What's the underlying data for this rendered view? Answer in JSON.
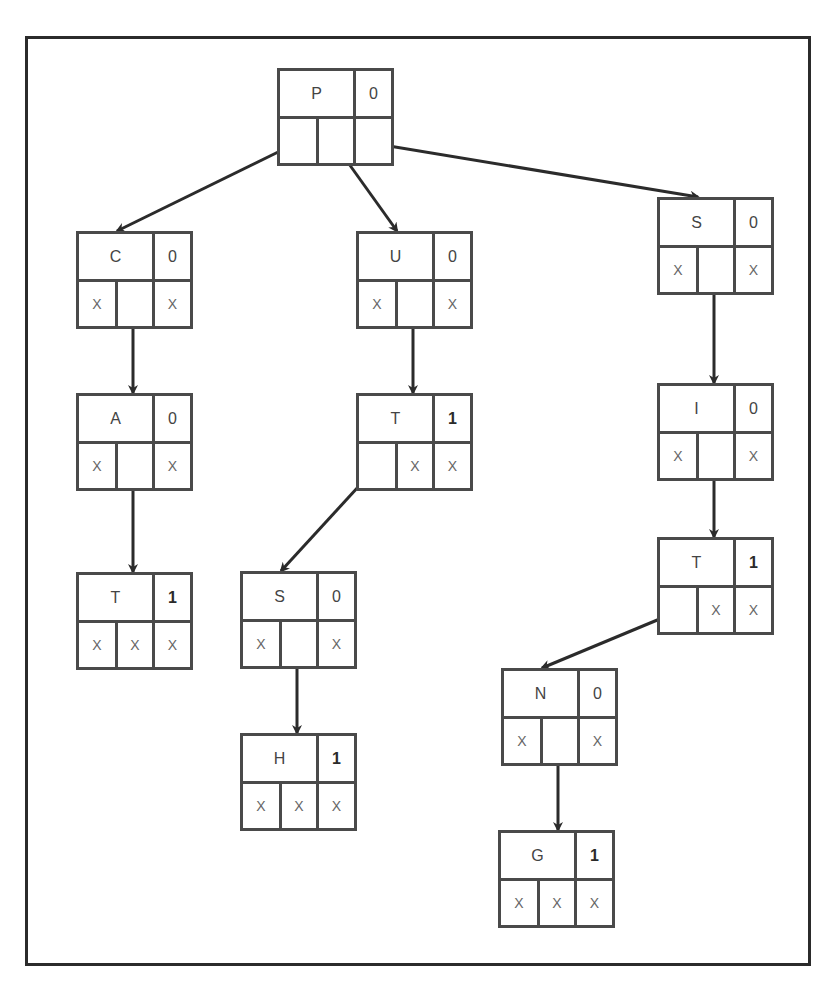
{
  "diagram": {
    "type": "trie",
    "cell_empty_marker": "X",
    "nodes": [
      {
        "id": "P",
        "letter": "P",
        "end_flag": "0",
        "children": [
          "",
          "",
          ""
        ]
      },
      {
        "id": "C",
        "letter": "C",
        "end_flag": "0",
        "children": [
          "X",
          "",
          "X"
        ]
      },
      {
        "id": "U",
        "letter": "U",
        "end_flag": "0",
        "children": [
          "X",
          "",
          "X"
        ]
      },
      {
        "id": "S1",
        "letter": "S",
        "end_flag": "0",
        "children": [
          "X",
          "",
          "X"
        ]
      },
      {
        "id": "A",
        "letter": "A",
        "end_flag": "0",
        "children": [
          "X",
          "",
          "X"
        ]
      },
      {
        "id": "T1",
        "letter": "T",
        "end_flag": "1",
        "children": [
          "",
          "X",
          "X"
        ]
      },
      {
        "id": "I",
        "letter": "I",
        "end_flag": "0",
        "children": [
          "X",
          "",
          "X"
        ]
      },
      {
        "id": "T2",
        "letter": "T",
        "end_flag": "1",
        "children": [
          "X",
          "X",
          "X"
        ]
      },
      {
        "id": "S2",
        "letter": "S",
        "end_flag": "0",
        "children": [
          "X",
          "",
          "X"
        ]
      },
      {
        "id": "T3",
        "letter": "T",
        "end_flag": "1",
        "children": [
          "",
          "X",
          "X"
        ]
      },
      {
        "id": "N",
        "letter": "N",
        "end_flag": "0",
        "children": [
          "X",
          "",
          "X"
        ]
      },
      {
        "id": "H",
        "letter": "H",
        "end_flag": "1",
        "children": [
          "X",
          "X",
          "X"
        ]
      },
      {
        "id": "G",
        "letter": "G",
        "end_flag": "1",
        "children": [
          "X",
          "X",
          "X"
        ]
      }
    ],
    "edges": [
      {
        "from": "P",
        "from_cell": 0,
        "to": "C"
      },
      {
        "from": "P",
        "from_cell": 1,
        "to": "U"
      },
      {
        "from": "P",
        "from_cell": 2,
        "to": "S1"
      },
      {
        "from": "C",
        "from_cell": 1,
        "to": "A"
      },
      {
        "from": "U",
        "from_cell": 1,
        "to": "T1"
      },
      {
        "from": "S1",
        "from_cell": 1,
        "to": "I"
      },
      {
        "from": "A",
        "from_cell": 1,
        "to": "T2"
      },
      {
        "from": "T1",
        "from_cell": 0,
        "to": "S2"
      },
      {
        "from": "I",
        "from_cell": 1,
        "to": "T3"
      },
      {
        "from": "T3",
        "from_cell": 0,
        "to": "N"
      },
      {
        "from": "S2",
        "from_cell": 1,
        "to": "H"
      },
      {
        "from": "N",
        "from_cell": 1,
        "to": "G"
      }
    ]
  }
}
